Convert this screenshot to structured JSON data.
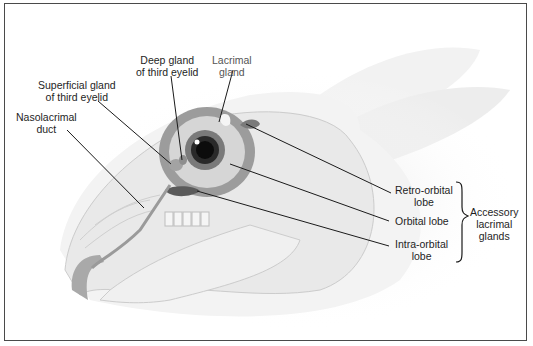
{
  "diagram": {
    "labels": {
      "deep_gland": "Deep gland\nof third eyelid",
      "lacrimal_gland": "Lacrimal\ngland",
      "superficial_gland": "Superficial gland\nof third eyelid",
      "nasolacrimal_duct": "Nasolacrimal\nduct",
      "retro_orbital": "Retro-orbital\nlobe",
      "orbital": "Orbital lobe",
      "intra_orbital": "Intra-orbital\nlobe",
      "accessory_group": "Accessory\nlacrimal\nglands"
    },
    "colors": {
      "border": "#4a4a4a",
      "leader": "#1a1a1a",
      "gland_dark": "#5a5a5a",
      "gland_mid": "#8c8c8c",
      "skull": "#e2e2e2",
      "eye_pupil": "#111111"
    }
  }
}
